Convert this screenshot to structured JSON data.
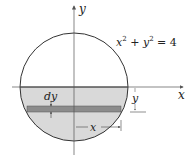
{
  "figure": {
    "equation": {
      "x": "x",
      "sup1": "2",
      "plus": " + ",
      "y": "y",
      "sup2": "2",
      "rhs": " = 4"
    },
    "labels": {
      "y_axis": "y",
      "x_axis": "x",
      "dy": "dy",
      "strip_y": "y",
      "strip_x": "x"
    },
    "colors": {
      "circle_stroke": "#333333",
      "shaded_region": "#d9d9d9",
      "strip": "#8c8c8c",
      "axis": "#555555"
    }
  }
}
